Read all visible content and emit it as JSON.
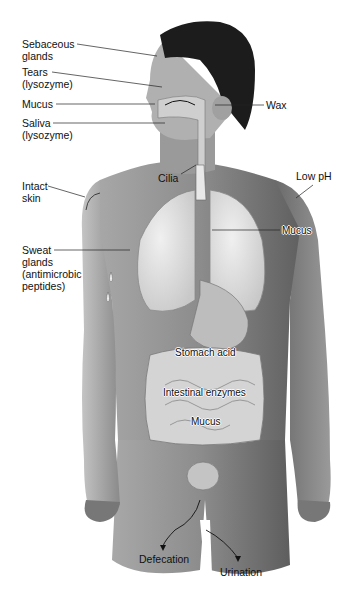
{
  "figure": {
    "colors": {
      "skin": "#8a8a8a",
      "skin_light": "#b5b5b5",
      "hair": "#1a1a1a",
      "organ": "#d8d8d8",
      "leader": "#222222"
    }
  },
  "labels": {
    "sebaceous": {
      "line1": "Sebaceous",
      "line2": "glands"
    },
    "tears": {
      "line1": "Tears",
      "line2": "(lysozyme)"
    },
    "mucus_nose": "Mucus",
    "saliva": {
      "line1": "Saliva",
      "line2": "(lysozyme)"
    },
    "wax": "Wax",
    "cilia": "Cilia",
    "intact_skin": {
      "line1": "Intact",
      "line2": "skin"
    },
    "low_ph": "Low pH",
    "mucus_lungs": "Mucus",
    "sweat": {
      "line1": "Sweat",
      "line2": "glands",
      "line3": "(antimicrobic",
      "line4": "peptides)"
    },
    "stomach_acid": "Stomach acid",
    "intestinal_enzymes": "Intestinal enzymes",
    "mucus_intestine": "Mucus",
    "defecation": "Defecation",
    "urination": "Urination"
  }
}
